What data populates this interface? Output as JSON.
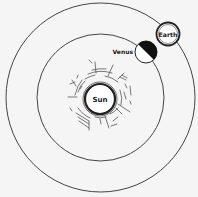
{
  "diagram": {
    "title": "",
    "colors": {
      "background": "#f5f5f5",
      "line": "#3a3a3a",
      "dark": "#111111",
      "fill": "#ffffff"
    },
    "center": {
      "x": 100.5,
      "y": 97.5
    },
    "orbits": [
      {
        "name": "venus-orbit",
        "radius": 63.5
      },
      {
        "name": "earth-orbit",
        "radius": 94.5
      }
    ],
    "bodies": {
      "sun": {
        "label": "Sun",
        "x": 100,
        "y": 99,
        "r": 15
      },
      "venus": {
        "label": "Venus",
        "x": 146,
        "y": 52,
        "r": 11,
        "phase": "half-lit, dark side facing away from Sun"
      },
      "earth": {
        "label": "Earth",
        "x": 168,
        "y": 34,
        "r": 11.5
      }
    }
  }
}
